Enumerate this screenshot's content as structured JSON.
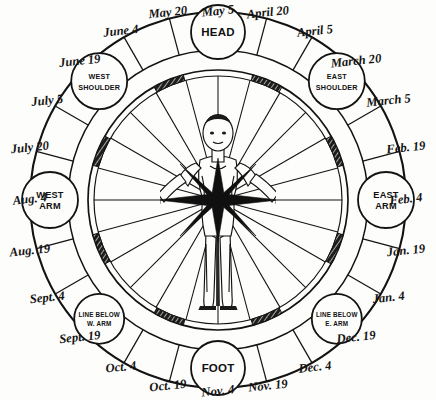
{
  "diagram": {
    "type": "radial-calendar-body-chart",
    "center": {
      "x": 218,
      "y": 200
    },
    "radii": {
      "outer": 188,
      "band_inner": 150,
      "ring_a": 130,
      "ring_b": 124,
      "label": 203
    },
    "colors": {
      "ink": "#131313",
      "paper": "#fdfdfb",
      "hatch": "#1a1a1a"
    },
    "figure": {
      "description": "standing human figure, arms outstretched horizontally, radiating eight-point star at solar plexus",
      "name": "zodiacal-man"
    }
  },
  "date_labels": [
    {
      "text": "May 5",
      "angle": -90
    },
    {
      "text": "May 20",
      "angle": -105
    },
    {
      "text": "June 4",
      "angle": -120
    },
    {
      "text": "June 19",
      "angle": -135
    },
    {
      "text": "July 5",
      "angle": -150
    },
    {
      "text": "July 20",
      "angle": -165
    },
    {
      "text": "Aug. 4",
      "angle": 180
    },
    {
      "text": "Aug. 19",
      "angle": 165
    },
    {
      "text": "Sept. 4",
      "angle": 150
    },
    {
      "text": "Sept. 19",
      "angle": 135
    },
    {
      "text": "Oct. 4",
      "angle": 120
    },
    {
      "text": "Oct. 19",
      "angle": 105
    },
    {
      "text": "Nov. 4",
      "angle": 90
    },
    {
      "text": "Nov. 19",
      "angle": 75
    },
    {
      "text": "Dec. 4",
      "angle": 60
    },
    {
      "text": "Dec. 19",
      "angle": 45
    },
    {
      "text": "Jan. 4",
      "angle": 30
    },
    {
      "text": "Jan. 19",
      "angle": 15
    },
    {
      "text": "Feb. 4",
      "angle": 0
    },
    {
      "text": "Feb. 19",
      "angle": -15
    },
    {
      "text": "March 5",
      "angle": -30
    },
    {
      "text": "March 20",
      "angle": -45
    },
    {
      "text": "April 5",
      "angle": -60
    },
    {
      "text": "April 20",
      "angle": -75
    }
  ],
  "body_nodes": [
    {
      "id": "head",
      "lines": [
        "HEAD"
      ],
      "angle": -90,
      "size": "big"
    },
    {
      "id": "east-shoulder",
      "lines": [
        "EAST",
        "SHOULDER"
      ],
      "angle": -45,
      "size": "sml"
    },
    {
      "id": "east-arm",
      "lines": [
        "EAST",
        "ARM"
      ],
      "angle": 0,
      "size": "med"
    },
    {
      "id": "line-below-e-arm",
      "lines": [
        "LINE BELOW",
        "E. ARM"
      ],
      "angle": 45,
      "size": "xsml"
    },
    {
      "id": "foot",
      "lines": [
        "FOOT"
      ],
      "angle": 90,
      "size": "big"
    },
    {
      "id": "line-below-w-arm",
      "lines": [
        "LINE BELOW",
        "W. ARM"
      ],
      "angle": 135,
      "size": "xsml"
    },
    {
      "id": "west-arm",
      "lines": [
        "WEST",
        "ARM"
      ],
      "angle": 180,
      "size": "med"
    },
    {
      "id": "west-shoulder",
      "lines": [
        "WEST",
        "SHOULDER"
      ],
      "angle": -135,
      "size": "sml"
    }
  ],
  "hatched_segments": [
    {
      "center_angle": -112.5
    },
    {
      "center_angle": -67.5
    },
    {
      "center_angle": -157.5
    },
    {
      "center_angle": -22.5
    },
    {
      "center_angle": 157.5
    },
    {
      "center_angle": 22.5
    },
    {
      "center_angle": 112.5
    },
    {
      "center_angle": 67.5
    }
  ]
}
